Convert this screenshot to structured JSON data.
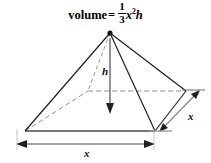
{
  "figure": {
    "title_text": "volume =",
    "formula": {
      "lead_word": "volume",
      "equals": "=",
      "numerator": "1",
      "denominator": "3",
      "variable": "x",
      "exponent": "2",
      "trailing_variable": "h",
      "plain": "volume = 1/3 x^2 h"
    },
    "shape": "square-pyramid",
    "labels": {
      "height_label": "h",
      "base_width_label": "x",
      "base_depth_label": "x"
    },
    "colors": {
      "stroke": "#1a1a1a",
      "hidden_stroke": "#8c8c8c",
      "dimension_stroke": "#7a7a7a",
      "background": "#ffffff",
      "text": "#000000"
    },
    "geometry": {
      "apex": [
        110,
        33
      ],
      "base_front_left": [
        25,
        131
      ],
      "base_front_right": [
        155,
        131
      ],
      "base_back_right": [
        186,
        91
      ],
      "base_back_left": [
        88,
        91
      ],
      "base_center": [
        113,
        112
      ],
      "height_top": [
        110,
        40
      ],
      "height_bottom": [
        110,
        113
      ]
    }
  }
}
